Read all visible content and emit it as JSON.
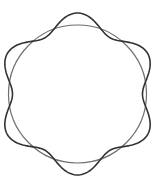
{
  "diagram": {
    "background": "#ffffff",
    "circle": {
      "cx": 77.5,
      "cy": 94,
      "r": 69,
      "stroke": "#6e6e6e",
      "stroke_width": 1.2
    },
    "wave": {
      "cx": 77.5,
      "cy": 94,
      "base_r": 73,
      "amplitude": 8,
      "lobes": 6,
      "phase_deg": 90,
      "stroke": "#333333",
      "stroke_width": 1.6
    }
  }
}
